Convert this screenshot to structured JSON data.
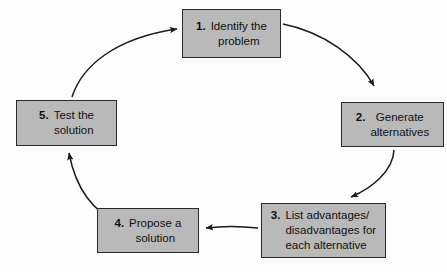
{
  "diagram": {
    "type": "cycle",
    "background_color": "#fdfdfd",
    "box_fill_color": "#b9b9b9",
    "box_border_color": "#2a2a2a",
    "arrow_color": "#1a1a1a",
    "steps": [
      {
        "number": "1.",
        "text": "Identify the\nproblem",
        "align": "center"
      },
      {
        "number": "2.",
        "text": "Generate\nalternatives",
        "align": "center"
      },
      {
        "number": "3.",
        "text": "List advantages/\ndisadvantages for\neach alternative",
        "align": "left"
      },
      {
        "number": "4.",
        "text": "Propose a\nsolution",
        "align": "center"
      },
      {
        "number": "5.",
        "text": "Test the\nsolution",
        "align": "center"
      }
    ],
    "connectors": [
      {
        "from": "1",
        "to": "2",
        "shape": "curve-clockwise"
      },
      {
        "from": "2",
        "to": "3",
        "shape": "curve-clockwise"
      },
      {
        "from": "3",
        "to": "4",
        "shape": "straight-left"
      },
      {
        "from": "4",
        "to": "5",
        "shape": "curve-clockwise"
      },
      {
        "from": "5",
        "to": "1",
        "shape": "curve-clockwise"
      }
    ]
  }
}
